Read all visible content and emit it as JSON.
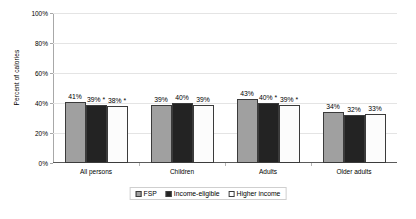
{
  "chart_data": {
    "type": "bar",
    "title": "",
    "subtitle": "",
    "xlabel": "",
    "ylabel": "Percent of calories",
    "ylim": [
      0,
      100
    ],
    "yunit": "%",
    "grid": true,
    "legend_position": "bottom",
    "categories": [
      "All persons",
      "Children",
      "Adults",
      "Older adults"
    ],
    "ytick_labels": [
      "0%",
      "20%",
      "40%",
      "60%",
      "80%",
      "100%"
    ],
    "ytick_values": [
      0,
      20,
      40,
      60,
      80,
      100
    ],
    "series": [
      {
        "name": "FSP",
        "color": "#a0a0a0",
        "values": [
          41,
          39,
          43,
          34
        ],
        "labels": [
          "41%",
          "39%",
          "43%",
          "34%"
        ]
      },
      {
        "name": "Income-eligible",
        "color": "#232323",
        "values": [
          39,
          40,
          40,
          32
        ],
        "labels": [
          "39% *",
          "40%",
          "40% *",
          "32%"
        ]
      },
      {
        "name": "Higher income",
        "color": "#ffffff",
        "values": [
          38,
          39,
          39,
          33
        ],
        "labels": [
          "38% *",
          "39%",
          "39% *",
          "33%"
        ]
      }
    ],
    "annotations": [
      "* denotes statistical significance"
    ]
  }
}
